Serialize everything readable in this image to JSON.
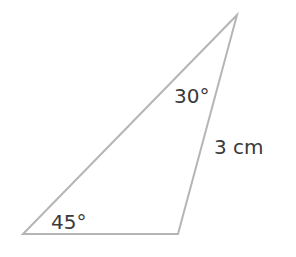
{
  "diagram": {
    "type": "triangle",
    "vertices": {
      "top": [
        237,
        15
      ],
      "bottom_left": [
        23,
        234
      ],
      "bottom_right": [
        178,
        234
      ]
    },
    "stroke_color": "#b5b5b5",
    "text_color": "#3a3a3a",
    "labels": {
      "angle_top": "30°",
      "angle_bottom_left": "45°",
      "side_right": "3 cm"
    }
  }
}
